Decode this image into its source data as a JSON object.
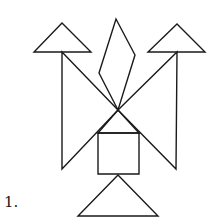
{
  "figure": {
    "label": "1.",
    "stroke_color": "#1a1a1a",
    "background": "#ffffff",
    "shapes": [
      {
        "name": "top-left-small-triangle",
        "type": "triangle",
        "points": [
          [
            62,
            23
          ],
          [
            34,
            52
          ],
          [
            91,
            52
          ]
        ]
      },
      {
        "name": "top-right-small-triangle",
        "type": "triangle",
        "points": [
          [
            177,
            24
          ],
          [
            148,
            52
          ],
          [
            205,
            52
          ]
        ]
      },
      {
        "name": "parallelogram",
        "type": "parallelogram",
        "points": [
          [
            116,
            19
          ],
          [
            135,
            55
          ],
          [
            118,
            110
          ],
          [
            99,
            73
          ]
        ]
      },
      {
        "name": "left-large-triangle",
        "type": "triangle",
        "points": [
          [
            62,
            52
          ],
          [
            62,
            169
          ],
          [
            118,
            110
          ]
        ]
      },
      {
        "name": "right-large-triangle",
        "type": "triangle",
        "points": [
          [
            177,
            52
          ],
          [
            176,
            169
          ],
          [
            118,
            110
          ]
        ]
      },
      {
        "name": "center-medium-triangle",
        "type": "triangle",
        "points": [
          [
            118,
            110
          ],
          [
            98,
            133
          ],
          [
            139,
            133
          ]
        ]
      },
      {
        "name": "square",
        "type": "square",
        "points": [
          [
            98,
            133
          ],
          [
            139,
            133
          ],
          [
            139,
            174
          ],
          [
            98,
            174
          ]
        ]
      },
      {
        "name": "bottom-triangle",
        "type": "triangle",
        "points": [
          [
            118,
            175
          ],
          [
            78,
            216
          ],
          [
            158,
            216
          ]
        ]
      }
    ]
  }
}
